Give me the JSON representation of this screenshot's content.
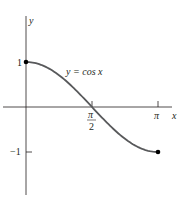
{
  "chart_data": {
    "type": "line",
    "title": "",
    "curve_label": "y = cos x",
    "xlabel": "x",
    "ylabel": "y",
    "x_ticks": [
      {
        "value": 1.5708,
        "label_top": "π",
        "label_bottom": "2"
      },
      {
        "value": 3.1416,
        "label": "π"
      }
    ],
    "y_ticks": [
      {
        "value": 1,
        "label": "1"
      },
      {
        "value": -1,
        "label": "-1"
      }
    ],
    "xlim": [
      0,
      3.1416
    ],
    "ylim": [
      -1,
      1
    ],
    "grid": false,
    "endpoints": [
      {
        "x": 0,
        "y": 1,
        "marker": "filled-dot"
      },
      {
        "x": 3.1416,
        "y": -1,
        "marker": "filled-dot"
      }
    ],
    "series": [
      {
        "name": "y = cos x",
        "function": "cos(x)",
        "domain": [
          0,
          3.1416
        ],
        "x": [
          0,
          0.3927,
          0.7854,
          1.1781,
          1.5708,
          1.9635,
          2.3562,
          2.7489,
          3.1416
        ],
        "values": [
          1,
          0.924,
          0.707,
          0.383,
          0,
          -0.383,
          -0.707,
          -0.924,
          -1
        ]
      }
    ],
    "colors": {
      "curve": "#58595b",
      "axes": "#231f20",
      "points": "#000000"
    }
  },
  "labels": {
    "y_axis": "y",
    "x_axis": "x",
    "curve": "y = cos x",
    "tick_one": "1",
    "tick_neg_one": "−1",
    "tick_pi": "π",
    "tick_half_pi_num": "π",
    "tick_half_pi_den": "2"
  }
}
